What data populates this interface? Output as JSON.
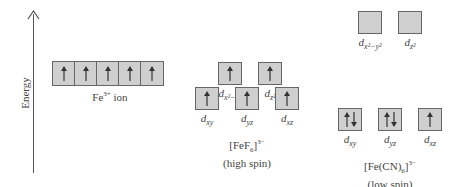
{
  "axis": {
    "label": "Energy"
  },
  "free_ion": {
    "label": "Fe",
    "charge": "3+",
    "suffix": " ion",
    "orbitals": [
      {
        "electrons": "up"
      },
      {
        "electrons": "up"
      },
      {
        "electrons": "up"
      },
      {
        "electrons": "up"
      },
      {
        "electrons": "up"
      }
    ]
  },
  "high_spin": {
    "formula_main": "[FeF",
    "formula_sub": "6",
    "formula_close": "]",
    "formula_charge": "3−",
    "spin_label": "(high spin)",
    "eg": [
      {
        "label_d": "d",
        "label_sub": "x²−y²",
        "electrons": "up"
      },
      {
        "label_d": "d",
        "label_sub": "z²",
        "electrons": "up"
      }
    ],
    "t2g": [
      {
        "label_d": "d",
        "label_sub": "xy",
        "electrons": "up"
      },
      {
        "label_d": "d",
        "label_sub": "yz",
        "electrons": "up"
      },
      {
        "label_d": "d",
        "label_sub": "xz",
        "electrons": "up"
      }
    ]
  },
  "low_spin": {
    "formula_main": "[Fe(CN)",
    "formula_sub": "6",
    "formula_close": "]",
    "formula_charge": "3−",
    "spin_label": "(low spin)",
    "eg": [
      {
        "label_d": "d",
        "label_sub": "x²−y²",
        "electrons": "empty"
      },
      {
        "label_d": "d",
        "label_sub": "z²",
        "electrons": "empty"
      }
    ],
    "t2g": [
      {
        "label_d": "d",
        "label_sub": "xy",
        "electrons": "pair"
      },
      {
        "label_d": "d",
        "label_sub": "yz",
        "electrons": "pair"
      },
      {
        "label_d": "d",
        "label_sub": "xz",
        "electrons": "up"
      }
    ]
  },
  "colors": {
    "box_fill": "#cfcfcf",
    "box_border": "#666666",
    "arrow": "#333333"
  }
}
